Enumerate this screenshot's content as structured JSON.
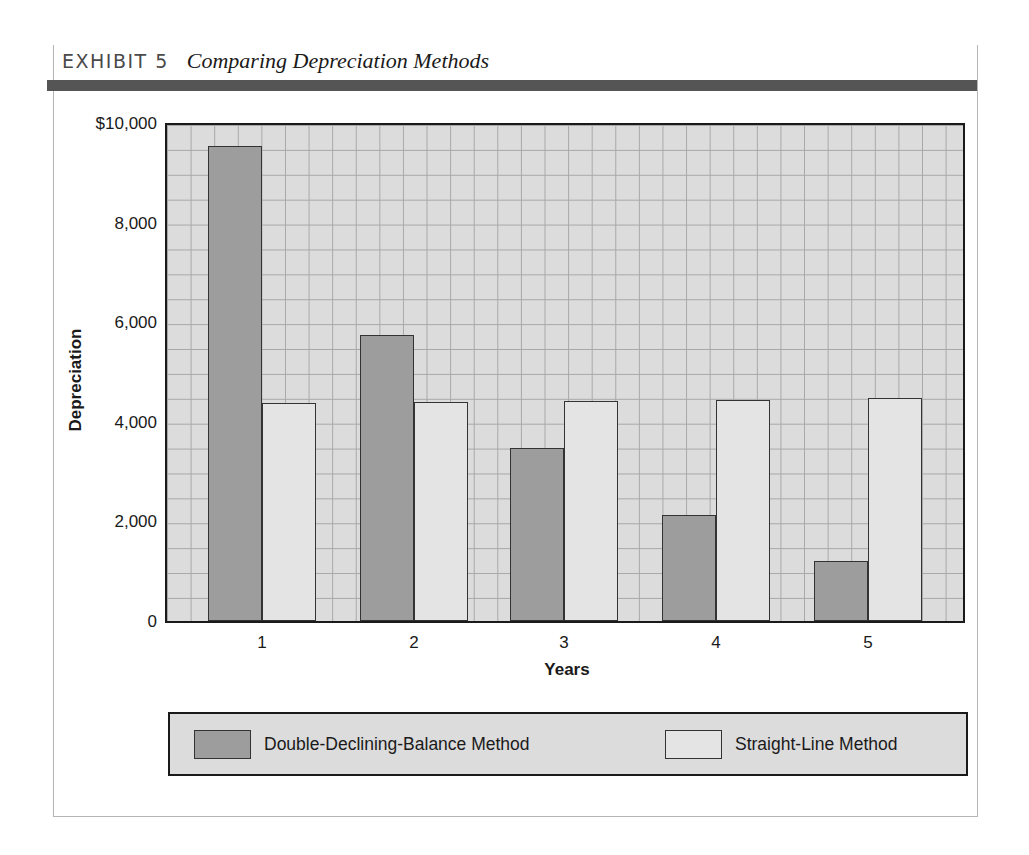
{
  "exhibit": {
    "label": "EXHIBIT 5",
    "title": "Comparing Depreciation Methods"
  },
  "colors": {
    "ddb": "#9d9d9d",
    "sl": "#e4e4e4",
    "plot_bg": "#dcdcdc",
    "header_bar": "#555555"
  },
  "chart_data": {
    "type": "bar",
    "title": "Comparing Depreciation Methods",
    "xlabel": "Years",
    "ylabel": "Depreciation",
    "categories": [
      "1",
      "2",
      "3",
      "4",
      "5"
    ],
    "series": [
      {
        "name": "Double-Declining-Balance Method",
        "values": [
          9540,
          5740,
          3470,
          2130,
          1200
        ]
      },
      {
        "name": "Straight-Line Method",
        "values": [
          4380,
          4400,
          4420,
          4440,
          4480
        ]
      }
    ],
    "ylim": [
      0,
      10000
    ],
    "yticks": [
      "0",
      "2,000",
      "4,000",
      "6,000",
      "8,000",
      "$10,000"
    ],
    "ytick_values": [
      0,
      2000,
      4000,
      6000,
      8000,
      10000
    ],
    "grid": true,
    "legend_position": "bottom"
  },
  "legend": {
    "items": [
      {
        "label": "Double-Declining-Balance Method"
      },
      {
        "label": "Straight-Line Method"
      }
    ]
  }
}
